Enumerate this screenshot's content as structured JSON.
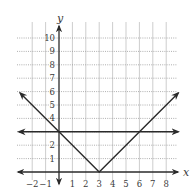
{
  "chart_data": {
    "type": "line",
    "title": "",
    "xlabel": "x",
    "ylabel": "y",
    "xlim": [
      -2,
      8
    ],
    "ylim": [
      0,
      10
    ],
    "grid": true,
    "x_ticks": [
      "−2",
      "−1",
      "1",
      "2",
      "3",
      "4",
      "5",
      "6",
      "7",
      "8"
    ],
    "y_ticks": [
      "1",
      "2",
      "4",
      "5",
      "6",
      "7",
      "8",
      "9",
      "10"
    ],
    "series": [
      {
        "name": "y = |x − 3|",
        "points": [
          [
            -2.9,
            5.9
          ],
          [
            0,
            3
          ],
          [
            3,
            0
          ],
          [
            8.9,
            5.9
          ]
        ],
        "arrows": "both"
      },
      {
        "name": "y = 3",
        "points": [
          [
            -3,
            3
          ],
          [
            8.9,
            3
          ]
        ],
        "arrows": "both"
      }
    ],
    "intersections": [
      [
        0,
        3
      ],
      [
        6,
        3
      ]
    ],
    "vertex": [
      3,
      0
    ]
  },
  "labels": {
    "x_axis": "x",
    "y_axis": "y"
  }
}
